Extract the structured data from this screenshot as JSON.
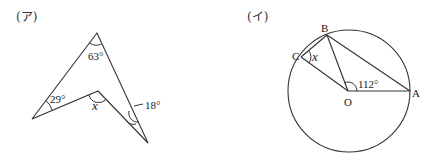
{
  "figures": [
    {
      "label": "(ア)",
      "angles": {
        "top": "63°",
        "left": "29°",
        "inner": "x",
        "right": "18°"
      }
    },
    {
      "label": "(イ)",
      "points": {
        "A": "A",
        "B": "B",
        "C": "C",
        "O": "O"
      },
      "angles": {
        "AOB": "112°",
        "BCO": "x"
      }
    }
  ]
}
